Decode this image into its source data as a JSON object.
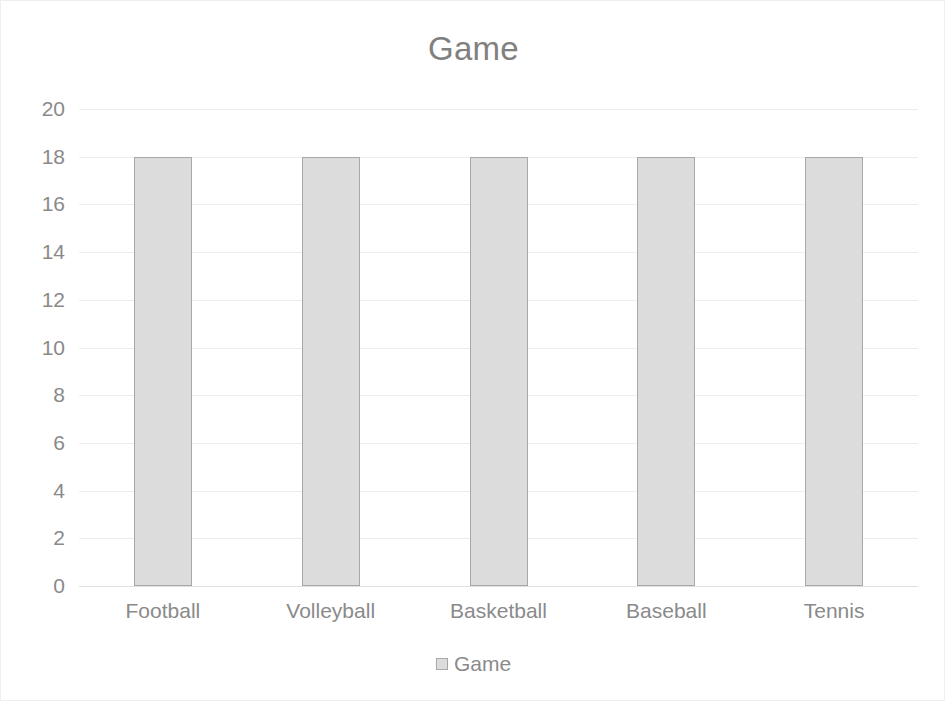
{
  "chart_data": {
    "type": "bar",
    "title": "Game",
    "categories": [
      "Football",
      "Volleyball",
      "Basketball",
      "Baseball",
      "Tennis"
    ],
    "values": [
      18,
      18,
      18,
      18,
      18
    ],
    "series": [
      {
        "name": "Game",
        "values": [
          18,
          18,
          18,
          18,
          18
        ]
      }
    ],
    "xlabel": "",
    "ylabel": "",
    "ylim": [
      0,
      20
    ],
    "y_ticks": [
      20,
      18,
      16,
      14,
      12,
      10,
      8,
      6,
      4,
      2,
      0
    ],
    "y_tick_step": 2,
    "grid": true,
    "grid_axis": "y",
    "legend": {
      "position": "bottom",
      "entries": [
        {
          "label": "Game",
          "swatch_name": "legend-swatch-game"
        }
      ]
    },
    "colors": {
      "bar_fill": "#dcdcdc",
      "bar_border": "#a8a8a8",
      "title_text": "#808080",
      "axis_text": "#8a8a8a",
      "gridline": "#ededed",
      "background": "#ffffff",
      "frame_border": "#efefef"
    }
  }
}
